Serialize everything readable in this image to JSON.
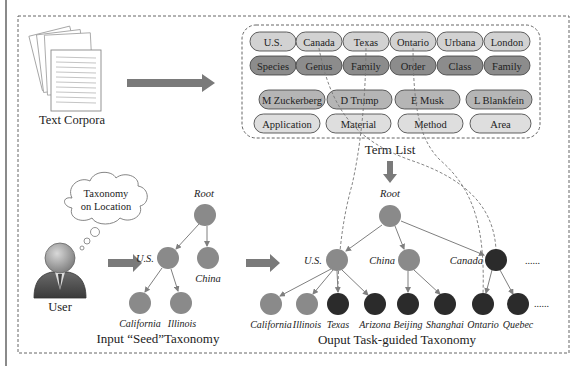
{
  "colors": {
    "arrow": "#7a7a7a",
    "node_light": "#8a8a8a",
    "node_dark": "#2b2b2b",
    "edge": "#7f7f7f",
    "pill_row1": "#d2d2d2",
    "pill_row2": "#8c8c8c",
    "pill_row3": "#b5b5b5",
    "pill_row4": "#dedede",
    "pill_stroke": "#3a3a3a",
    "dashed": "#666666"
  },
  "text_corpora": {
    "label": "Text Corpora"
  },
  "term_list": {
    "label": "Term List",
    "rows": [
      {
        "items": [
          "U.S.",
          "Canada",
          "Texas",
          "Ontario",
          "Urbana",
          "London"
        ]
      },
      {
        "items": [
          "Species",
          "Genus",
          "Family",
          "Order",
          "Class",
          "Family"
        ]
      },
      {
        "items": [
          "M Zuckerberg",
          "D Trump",
          "E Musk",
          "L Blankfein"
        ]
      },
      {
        "items": [
          "Application",
          "Material",
          "Method",
          "Area"
        ]
      }
    ]
  },
  "user": {
    "label": "User",
    "thought": {
      "line1": "Taxonomy",
      "line2": "on Location"
    }
  },
  "seed_taxonomy": {
    "title": "Input “Seed”Taxonomy",
    "nodes": {
      "root": "Root",
      "us": "U.S.",
      "china": "China",
      "california": "California",
      "illinois": "Illinois"
    }
  },
  "output_taxonomy": {
    "title": "Ouput Task-guided Taxonomy",
    "nodes": {
      "root": "Root",
      "us": "U.S.",
      "china": "China",
      "canada": "Canada",
      "california": "California",
      "illinois": "Illinois",
      "texas": "Texas",
      "arizona": "Arizona",
      "beijing": "Beijing",
      "shanghai": "Shanghai",
      "ontario": "Ontario",
      "quebec": "Quebec"
    },
    "ellipsis": "......"
  }
}
